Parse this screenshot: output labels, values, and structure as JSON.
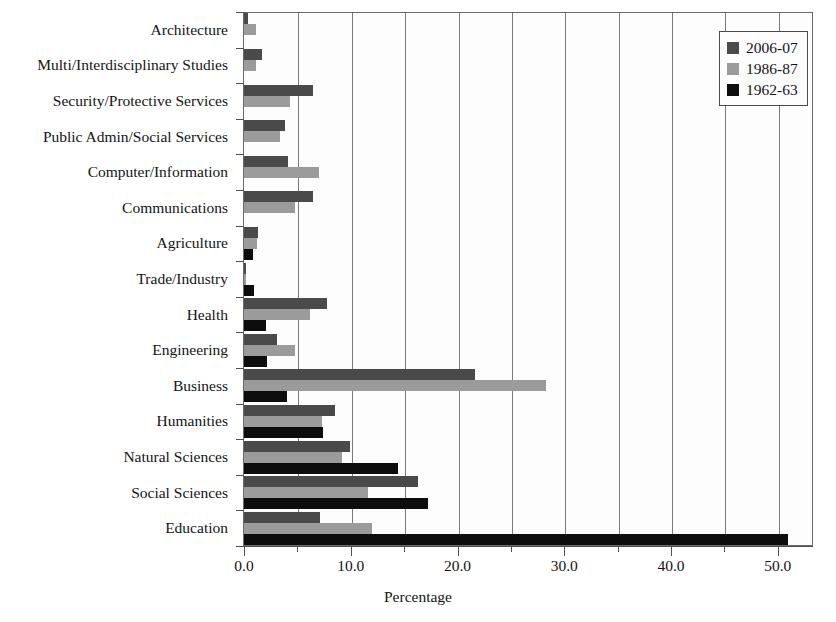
{
  "chart_data": {
    "type": "bar",
    "orientation": "horizontal",
    "title": "",
    "xlabel": "Percentage",
    "ylabel": "",
    "xlim": [
      0.0,
      53.3
    ],
    "xticks": [
      0.0,
      10.0,
      20.0,
      30.0,
      40.0,
      50.0
    ],
    "xticklabels": [
      "0.0",
      "10.0",
      "20.0",
      "30.0",
      "40.0",
      "50.0"
    ],
    "minor_xticks": [
      5.0,
      15.0,
      25.0,
      35.0,
      45.0
    ],
    "grid": "vertical",
    "legend_position": "top-right",
    "categories": [
      "Architecture",
      "Multi/Interdisciplinary Studies",
      "Security/Protective Services",
      "Public Admin/Social Services",
      "Computer/Information",
      "Communications",
      "Agriculture",
      "Trade/Industry",
      "Health",
      "Engineering",
      "Business",
      "Humanities",
      "Natural Sciences",
      "Social Sciences",
      "Education"
    ],
    "series": [
      {
        "name": "2006-07",
        "color": "#4a4a4a",
        "values": [
          0.4,
          1.7,
          6.5,
          3.8,
          4.1,
          6.5,
          1.3,
          0.1,
          7.8,
          3.1,
          21.6,
          8.5,
          9.9,
          16.3,
          7.1
        ]
      },
      {
        "name": "1986-87",
        "color": "#9b9b9b",
        "values": [
          1.1,
          1.1,
          4.3,
          3.4,
          7.0,
          4.8,
          1.2,
          0.1,
          6.2,
          4.8,
          28.3,
          7.3,
          9.2,
          11.6,
          12.0
        ]
      },
      {
        "name": "1962-63",
        "color": "#0d0d0d",
        "values": [
          0.0,
          0.0,
          0.0,
          0.0,
          0.0,
          0.0,
          0.8,
          0.9,
          2.1,
          2.2,
          4.0,
          7.4,
          14.4,
          17.2,
          51.0
        ]
      }
    ]
  },
  "legend": {
    "entries": [
      {
        "label": "2006-07",
        "swatch": "dark-gray-swatch"
      },
      {
        "label": "1986-87",
        "swatch": "light-gray-swatch"
      },
      {
        "label": "1962-63",
        "swatch": "black-swatch"
      }
    ]
  }
}
